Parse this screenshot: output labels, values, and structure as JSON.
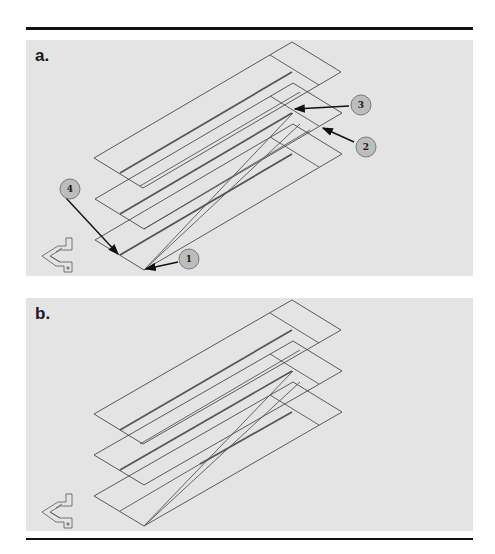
{
  "figure": {
    "panels": [
      {
        "label": "a.",
        "callouts": [
          {
            "number": "1"
          },
          {
            "number": "2"
          },
          {
            "number": "3"
          },
          {
            "number": "4"
          }
        ]
      },
      {
        "label": "b."
      }
    ],
    "triad_icon": "orientation-triad-icon",
    "colors": {
      "panel_bg": "#e4e4e4",
      "line": "#4a4a4a",
      "callout_fill": "#bdbdbd",
      "rule": "#111111"
    }
  }
}
